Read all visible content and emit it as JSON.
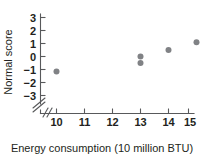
{
  "chart_data": {
    "type": "scatter",
    "title": "",
    "xlabel": "Energy consumption (10 million BTU)",
    "ylabel": "Normal score",
    "xlim": [
      9.45,
      15.6
    ],
    "ylim": [
      -3.6,
      3.5
    ],
    "xticks": [
      10,
      11,
      12,
      13,
      14,
      15
    ],
    "xtick_labels": [
      "10",
      "11",
      "12",
      "13",
      "14",
      "15"
    ],
    "yticks": [
      -3,
      -2,
      -1,
      0,
      1,
      2,
      3
    ],
    "ytick_labels": [
      "−3",
      "−2",
      "−1",
      "0",
      "1",
      "2",
      "3"
    ],
    "grid": false,
    "legend": null,
    "axis_break": {
      "axis": "x",
      "symbol": "//",
      "position": "origin"
    },
    "point_color": "#808285",
    "axis_color": "#58595b",
    "points": [
      {
        "x": 10,
        "y": -1.15,
        "label": "10, −1.15"
      },
      {
        "x": 13,
        "y": 0.0,
        "label": "13, 0.0"
      },
      {
        "x": 13,
        "y": -0.5,
        "label": "13, −0.5"
      },
      {
        "x": 14,
        "y": 0.5,
        "label": "14, 0.5"
      },
      {
        "x": 15,
        "y": 1.1,
        "label": "15, 1.1"
      }
    ],
    "series": [
      {
        "name": "Normal probability plot",
        "x": [
          10,
          13,
          13,
          14,
          15
        ],
        "values": [
          -1.15,
          0.0,
          -0.5,
          0.5,
          1.1
        ]
      }
    ]
  },
  "axes": {
    "x_title": "Energy consumption (10 million BTU)",
    "y_title": "Normal score"
  },
  "ticks": {
    "x": [
      "10",
      "11",
      "12",
      "13",
      "14",
      "15"
    ],
    "y": [
      "3",
      "2",
      "1",
      "0",
      "−1",
      "−2",
      "−3"
    ]
  }
}
